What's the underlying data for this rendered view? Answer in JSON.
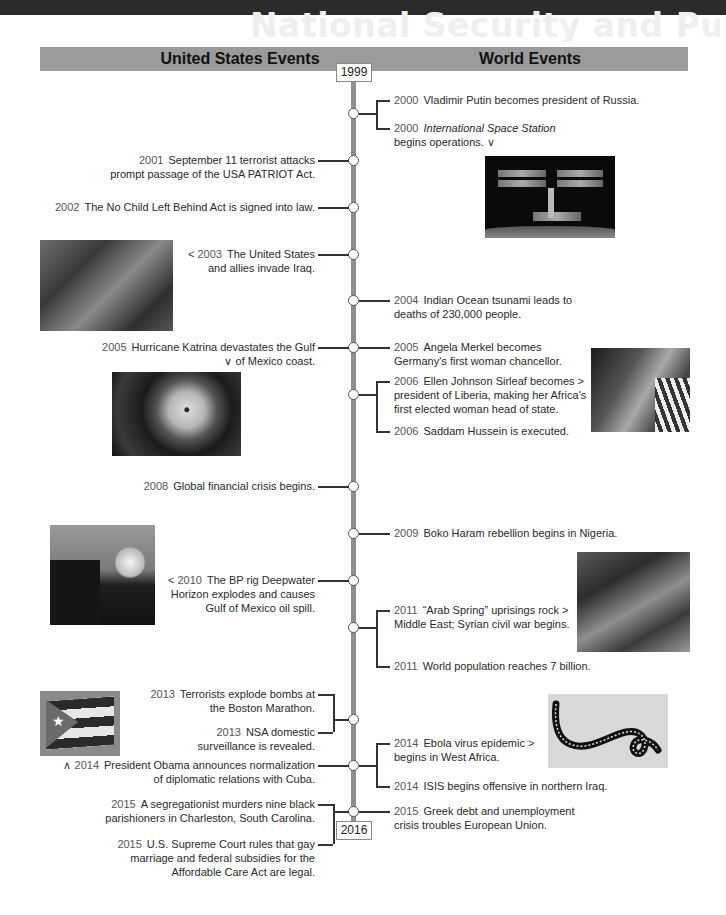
{
  "page": {
    "bleed_title": "National Security and Public Safety"
  },
  "header": {
    "left_label": "United States Events",
    "right_label": "World Events",
    "start_year": "1999",
    "end_year": "2016"
  },
  "us_events": [
    {
      "year": "2001",
      "text": "September 11 terrorist attacks prompt passage of the USA PATRIOT Act.",
      "arrow": ""
    },
    {
      "year": "2002",
      "text": "The No Child Left Behind Act is signed into law.",
      "arrow": ""
    },
    {
      "year": "2003",
      "text": "The United States and allies invade Iraq.",
      "arrow": "<"
    },
    {
      "year": "2005",
      "text": "Hurricane Katrina devastates the Gulf of Mexico coast.",
      "arrow": "∨"
    },
    {
      "year": "2008",
      "text": "Global financial crisis begins.",
      "arrow": ""
    },
    {
      "year": "2010",
      "text": "The BP rig Deepwater Horizon explodes and causes Gulf of Mexico oil spill.",
      "arrow": "<"
    },
    {
      "year": "2013",
      "text": "Terrorists explode bombs at the Boston Marathon.",
      "arrow": ""
    },
    {
      "year": "2013",
      "text": "NSA domestic surveillance is revealed.",
      "arrow": ""
    },
    {
      "year": "2014",
      "text": "President Obama announces normalization of diplomatic relations with Cuba.",
      "arrow": "∧"
    },
    {
      "year": "2015",
      "text": "A segregationist murders nine black parishioners in Charleston, South Carolina.",
      "arrow": ""
    },
    {
      "year": "2015",
      "text": "U.S. Supreme Court rules that gay marriage and federal subsidies for the Affordable Care Act are legal.",
      "arrow": ""
    }
  ],
  "us_lines": {
    "e0": [
      "September 11 terrorist attacks",
      "prompt passage of the USA PATRIOT Act."
    ],
    "e2": [
      "The United States",
      "and allies invade Iraq."
    ],
    "e3": [
      "Hurricane Katrina devastates the Gulf",
      "of Mexico coast."
    ],
    "e5": [
      "The BP rig Deepwater",
      "Horizon explodes and causes",
      "Gulf of Mexico oil spill."
    ],
    "e6": [
      "Terrorists explode bombs at",
      "the Boston Marathon."
    ],
    "e7": [
      "NSA domestic",
      "surveillance is revealed."
    ],
    "e8": [
      "President Obama announces normalization",
      "of diplomatic relations with Cuba."
    ],
    "e9": [
      "A segregationist murders nine black",
      "parishioners in Charleston, South Carolina."
    ],
    "e10": [
      "U.S. Supreme Court rules that gay",
      "marriage and federal subsidies for the",
      "Affordable Care Act are legal."
    ]
  },
  "world_events": [
    {
      "year": "2000",
      "text": "Vladimir Putin becomes president of Russia.",
      "arrow": ""
    },
    {
      "year": "2000",
      "text": "International Space Station begins operations.",
      "arrow": "∨"
    },
    {
      "year": "2004",
      "text": "Indian Ocean tsunami leads to deaths of 230,000 people.",
      "arrow": ""
    },
    {
      "year": "2005",
      "text": "Angela Merkel becomes Germany's first woman chancellor.",
      "arrow": ""
    },
    {
      "year": "2006",
      "text": "Ellen Johnson Sirleaf becomes president of Liberia, making her Africa's first elected woman head of state.",
      "arrow": ">"
    },
    {
      "year": "2006",
      "text": "Saddam Hussein is executed.",
      "arrow": ""
    },
    {
      "year": "2009",
      "text": "Boko Haram rebellion begins in Nigeria.",
      "arrow": ""
    },
    {
      "year": "2011",
      "text": "\"Arab Spring\" uprisings rock Middle East; Syrian civil war begins.",
      "arrow": ">"
    },
    {
      "year": "2011",
      "text": "World population reaches 7 billion.",
      "arrow": ""
    },
    {
      "year": "2014",
      "text": "Ebola virus epidemic begins in West Africa.",
      "arrow": ">"
    },
    {
      "year": "2014",
      "text": "ISIS begins offensive in northern Iraq.",
      "arrow": ""
    },
    {
      "year": "2015",
      "text": "Greek debt and unemployment crisis troubles European Union.",
      "arrow": ""
    }
  ],
  "world_lines": {
    "w1a": "International Space Station",
    "w1b": "begins operations.",
    "w2": [
      "Indian Ocean tsunami leads to",
      "deaths of 230,000 people."
    ],
    "w3": [
      "Angela Merkel becomes",
      "Germany's first woman chancellor."
    ],
    "w4": [
      "Ellen Johnson Sirleaf becomes",
      "president of Liberia, making her Africa's",
      "first elected woman head of state."
    ],
    "w7": [
      "“Arab Spring” uprisings rock",
      "Middle East; Syrian civil war begins."
    ],
    "w9": [
      "Ebola virus epidemic",
      "begins in West Africa."
    ],
    "w11": [
      "Greek debt and unemployment",
      "crisis troubles European Union."
    ]
  },
  "photos": {
    "iss": "International Space Station photo",
    "iraq": "Soldiers in Iraq photo",
    "katrina": "Hurricane Katrina satellite photo",
    "sirleaf": "Ellen Johnson Sirleaf photo",
    "bp": "Deepwater Horizon fire photo",
    "arab": "Arab Spring protesters photo",
    "cuba": "Cuban flag photo",
    "ebola": "Ebola virus micrograph"
  },
  "glyphs": {
    "arrow_left": "<",
    "arrow_right": ">",
    "arrow_down": "∨",
    "arrow_up": "∧",
    "star": "★"
  },
  "colors": {
    "header_bar": "#9b9b9b",
    "axis": "#8e8e8e",
    "text": "#2a2a2a",
    "top_band": "#2b2b2b"
  }
}
